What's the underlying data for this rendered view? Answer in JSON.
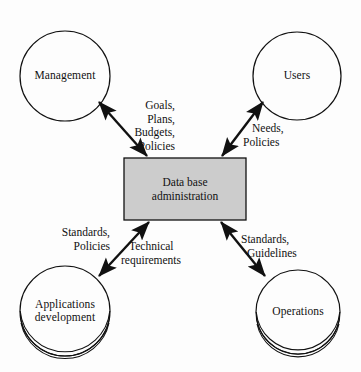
{
  "diagram": {
    "background_color": "#fdfdfd",
    "line_color": "#111111",
    "center": {
      "name": "data-base-administration",
      "line1": "Data base",
      "line2": "administration",
      "fill_color": "#cccccc",
      "border_color": "#111111",
      "x": 124,
      "y": 158,
      "width": 122,
      "height": 62
    },
    "nodes": [
      {
        "id": "management",
        "line1": "Management",
        "line2": "",
        "cx": 65,
        "cy": 76,
        "r": 45,
        "stack": "top"
      },
      {
        "id": "users",
        "line1": "Users",
        "line2": "",
        "cx": 297,
        "cy": 76,
        "r": 44,
        "stack": "top"
      },
      {
        "id": "applications-development",
        "line1": "Applications",
        "line2": "development",
        "cx": 65,
        "cy": 311,
        "r": 45,
        "stack": "bottom"
      },
      {
        "id": "operations",
        "line1": "Operations",
        "line2": "",
        "cx": 298,
        "cy": 312,
        "r": 42,
        "stack": "bottom"
      }
    ],
    "edges": [
      {
        "id": "management-edge",
        "from": "data-base-administration",
        "to": "management",
        "arrow": "double",
        "x1": 98,
        "y1": 101,
        "x2": 148,
        "y2": 157,
        "labels": [
          "Goals,",
          "Plans,",
          "Budgets,",
          "Policies"
        ],
        "label_align": "right",
        "label_x": 103,
        "label_y": 99,
        "label_width": 72
      },
      {
        "id": "users-edge",
        "from": "data-base-administration",
        "to": "users",
        "arrow": "double",
        "x1": 264,
        "y1": 101,
        "x2": 221,
        "y2": 157,
        "labels": [
          "Needs,",
          "Policies"
        ],
        "label_align": "left",
        "label_x": 243,
        "label_y": 122,
        "label_width": 60
      },
      {
        "id": "applications-development-edge",
        "from": "data-base-administration",
        "to": "applications-development",
        "arrow": "double",
        "x1": 148,
        "y1": 221,
        "x2": 98,
        "y2": 277,
        "labels": [
          "Standards,",
          "Policies"
        ],
        "labels_secondary": [
          "Technical",
          "requirements"
        ],
        "label_align": "right",
        "label_x": 47,
        "label_y": 226,
        "label_width": 63,
        "label2_x": 120,
        "label2_y": 240,
        "label2_width": 90
      },
      {
        "id": "operations-edge",
        "from": "data-base-administration",
        "to": "operations",
        "arrow": "double",
        "x1": 221,
        "y1": 221,
        "x2": 266,
        "y2": 277,
        "labels": [
          "Standards,",
          "Guidelines"
        ],
        "label_align": "left",
        "label_x": 243,
        "label_y": 233,
        "label_width": 72
      }
    ]
  }
}
